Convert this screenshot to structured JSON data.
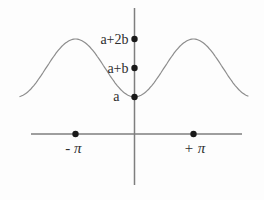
{
  "figure": {
    "colors": {
      "background": "#fdfdfd",
      "axis": "#7e7e7e",
      "curve": "#8d8d8d",
      "dot": "#1a1a1a",
      "text": "#2e2e2e"
    }
  },
  "chart_data": {
    "type": "line",
    "title": "",
    "function": "y = a + b(1 - cos x)",
    "x_range_pi": [
      -1.95,
      1.93
    ],
    "x_tick_labels": [
      "- π",
      "+ π"
    ],
    "x_tick_positions_pi": [
      -1,
      1
    ],
    "y_axis_dots": [
      "a",
      "a+b",
      "a+2b"
    ],
    "key_points": [
      {
        "x": "0",
        "y": "a",
        "feature": "minimum on y-axis"
      },
      {
        "x": "-π",
        "y": "a+2b",
        "feature": "maximum"
      },
      {
        "x": "+π",
        "y": "a+2b",
        "feature": "maximum"
      }
    ],
    "grid": false,
    "legend": false
  }
}
